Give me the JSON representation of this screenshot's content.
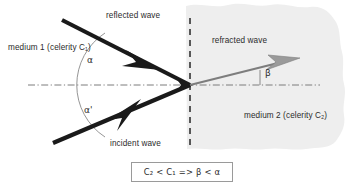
{
  "diagram": {
    "background_color": "#ffffff",
    "medium2_fill_color": "#eeeeee",
    "ray_color": "#1a1a1a",
    "refracted_ray_color": "#7d7d7d",
    "interface_line_color": "#4a4a4a",
    "axis_line_color": "#6e6e6e",
    "arc_color": "#6e6e6e"
  },
  "labels": {
    "reflected_wave": "reflected wave",
    "incident_wave": "incident wave",
    "refracted_wave": "refracted wave",
    "medium1": "medium 1 (celerity C₁)",
    "medium2": "medium 2 (celerity C₂)"
  },
  "angles": {
    "alpha": "α",
    "alpha_prime": "α'",
    "beta": "β"
  },
  "formula": {
    "text": "C₂ < C₁ =>  β < α"
  }
}
